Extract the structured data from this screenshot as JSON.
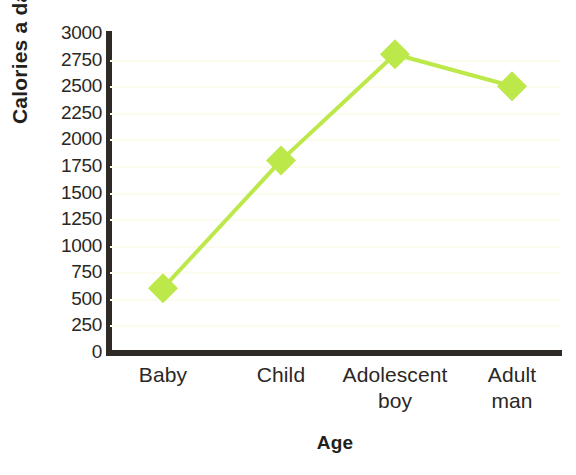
{
  "figure": {
    "title_remnant": "",
    "background_color": "#ffffff",
    "axis_color": "#2e2a26",
    "gridline_color": "#fbfbee",
    "series_color": "#bce84a"
  },
  "chart_data": {
    "type": "line",
    "title": "",
    "xlabel": "Age",
    "ylabel": "Calories a day",
    "categories": [
      "Baby",
      "Child",
      "Adolescent boy",
      "Adult man"
    ],
    "category_lines": [
      [
        "Baby"
      ],
      [
        "Child"
      ],
      [
        "Adolescent",
        "boy"
      ],
      [
        "Adult",
        "man"
      ]
    ],
    "values": [
      600,
      1800,
      2800,
      2500
    ],
    "series": [
      {
        "name": "Calories a day",
        "color": "#bce84a",
        "marker": "diamond",
        "values": [
          600,
          1800,
          2800,
          2500
        ]
      }
    ],
    "ylim": [
      0,
      3000
    ],
    "ytick_step": 250,
    "yticks": [
      3000,
      2750,
      2500,
      2250,
      2000,
      1750,
      1500,
      1250,
      1000,
      750,
      500,
      250,
      0
    ],
    "ytick_labels": [
      "3000",
      "2750",
      "2500",
      "2250",
      "2000",
      "1750",
      "1500",
      "1250",
      "1000",
      "750",
      "500",
      "250",
      "0"
    ],
    "grid": true,
    "grid_axis": "y",
    "legend": false,
    "legend_position": "none"
  }
}
